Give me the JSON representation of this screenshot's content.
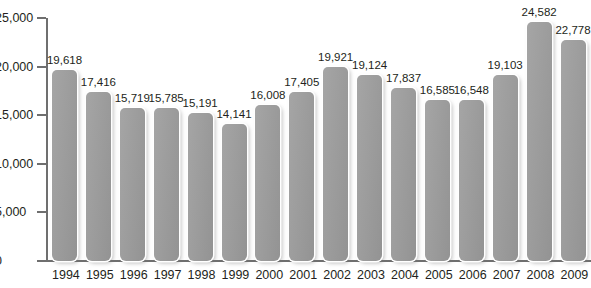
{
  "chart_data": {
    "type": "bar",
    "title": "",
    "subtitle": "",
    "xlabel": "",
    "ylabel": "",
    "categories": [
      "1994",
      "1995",
      "1996",
      "1997",
      "1998",
      "1999",
      "2000",
      "2001",
      "2002",
      "2003",
      "2004",
      "2005",
      "2006",
      "2007",
      "2008",
      "2009"
    ],
    "values": [
      19618,
      17416,
      15719,
      15785,
      15191,
      14141,
      16008,
      17405,
      19921,
      19124,
      17837,
      16585,
      16548,
      19103,
      24582,
      22778
    ],
    "data_labels": [
      "19,618",
      "17,416",
      "15,719",
      "15,785",
      "15,191",
      "14,141",
      "16,008",
      "17,405",
      "19,921",
      "19,124",
      "17,837",
      "16,585",
      "16,548",
      "19,103",
      "24,582",
      "22,778"
    ],
    "ylim": [
      0,
      25000
    ],
    "yticks": [
      0,
      5000,
      10000,
      15000,
      20000,
      25000
    ],
    "ytick_labels": [
      "0",
      "5,000",
      "10,000",
      "15,000",
      "20,000",
      "25,000"
    ],
    "xtick_labels": [
      "1994",
      "1995",
      "1996",
      "1997",
      "1998",
      "1999",
      "2000",
      "2001",
      "2002",
      "2003",
      "2004",
      "2005",
      "2006",
      "2007",
      "2008",
      "2009"
    ],
    "grid": false,
    "legend": null,
    "series": [
      {
        "name": "",
        "values": [
          19618,
          17416,
          15719,
          15785,
          15191,
          14141,
          16008,
          17405,
          19921,
          19124,
          17837,
          16585,
          16548,
          19103,
          24582,
          22778
        ]
      }
    ],
    "colors": {
      "bar_fill": "#9b9b9b",
      "bar_outline": "#ffffff",
      "axis": "#6f6f6f",
      "text": "#231f20",
      "background": "#ffffff"
    }
  },
  "artifact": {
    "top_clipped_text": ""
  }
}
